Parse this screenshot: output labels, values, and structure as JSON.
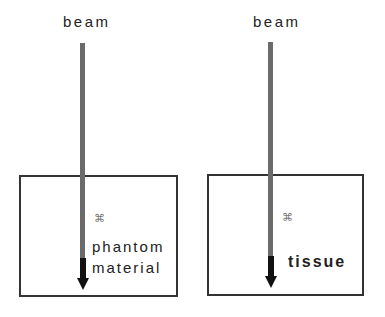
{
  "diagram": {
    "panels": [
      {
        "id": "phantom",
        "beam_label": "beam",
        "medium_label_line1": "phantom",
        "medium_label_line2": "material",
        "marker_glyph": "⌘"
      },
      {
        "id": "tissue",
        "beam_label": "beam",
        "medium_label": "tissue",
        "marker_glyph": "⌘"
      }
    ],
    "colors": {
      "beam": "#6b6b6b",
      "beam_end": "#111111",
      "box_border": "#333333",
      "text": "#222222"
    }
  }
}
